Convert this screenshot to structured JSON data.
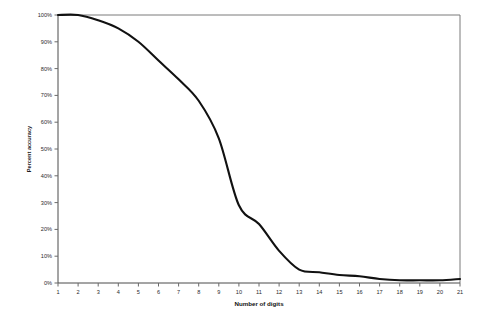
{
  "chart_data": {
    "type": "line",
    "title": "",
    "xlabel": "Number of digits",
    "ylabel": "Percent accuracy",
    "xlim": [
      1,
      21
    ],
    "ylim": [
      0,
      100
    ],
    "grid": false,
    "legend": null,
    "x": [
      1,
      2,
      3,
      4,
      5,
      6,
      7,
      8,
      9,
      10,
      11,
      12,
      13,
      14,
      15,
      16,
      17,
      18,
      19,
      20,
      21
    ],
    "x_tick_labels": [
      "1",
      "2",
      "3",
      "4",
      "5",
      "6",
      "7",
      "8",
      "9",
      "10",
      "11",
      "12",
      "13",
      "14",
      "15",
      "16",
      "17",
      "18",
      "19",
      "20",
      "21"
    ],
    "y_tick_labels": [
      "0%",
      "10%",
      "20%",
      "30%",
      "40%",
      "50%",
      "60%",
      "70%",
      "80%",
      "90%",
      "100%"
    ],
    "y_ticks": [
      0,
      10,
      20,
      30,
      40,
      50,
      60,
      70,
      80,
      90,
      100
    ],
    "series": [
      {
        "name": "Percent accuracy",
        "color": "#111111",
        "values": [
          100,
          100,
          98,
          95,
          90,
          83,
          76,
          68,
          54,
          29,
          22,
          12,
          5,
          4,
          3,
          2.5,
          1.5,
          1,
          1,
          1,
          1.5
        ]
      }
    ],
    "annotations": []
  }
}
